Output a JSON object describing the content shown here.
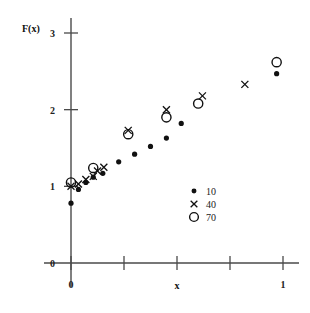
{
  "chart_data": {
    "type": "scatter",
    "title": "",
    "xlabel": "x",
    "ylabel": "F(x)",
    "xlim": [
      0,
      1
    ],
    "ylim": [
      0,
      3
    ],
    "grid": false,
    "legend_position": "inside-lower-right",
    "x_ticks": [
      0,
      0.25,
      0.5,
      0.75,
      1
    ],
    "x_tick_labels": [
      "0",
      "",
      "",
      "",
      "1"
    ],
    "y_ticks": [
      0,
      1,
      2,
      3
    ],
    "y_tick_labels": [
      "0",
      "1",
      "2",
      "3"
    ],
    "series": [
      {
        "name": "10",
        "marker": "filled-circle",
        "points": [
          [
            0.0,
            0.78
          ],
          [
            0.035,
            0.96
          ],
          [
            0.07,
            1.05
          ],
          [
            0.105,
            1.12
          ],
          [
            0.15,
            1.17
          ],
          [
            0.225,
            1.32
          ],
          [
            0.3,
            1.42
          ],
          [
            0.375,
            1.52
          ],
          [
            0.45,
            1.63
          ],
          [
            0.52,
            1.82
          ],
          [
            0.97,
            2.47
          ]
        ]
      },
      {
        "name": "40",
        "marker": "cross",
        "points": [
          [
            0.0,
            1.0
          ],
          [
            0.035,
            1.03
          ],
          [
            0.07,
            1.09
          ],
          [
            0.105,
            1.13
          ],
          [
            0.125,
            1.2
          ],
          [
            0.155,
            1.25
          ],
          [
            0.27,
            1.73
          ],
          [
            0.45,
            2.0
          ],
          [
            0.62,
            2.18
          ],
          [
            0.82,
            2.33
          ]
        ]
      },
      {
        "name": "70",
        "marker": "open-circle",
        "points": [
          [
            0.0,
            1.05
          ],
          [
            0.105,
            1.24
          ],
          [
            0.27,
            1.68
          ],
          [
            0.45,
            1.9
          ],
          [
            0.6,
            2.08
          ],
          [
            0.97,
            2.62
          ]
        ]
      }
    ]
  },
  "legend": {
    "entries": [
      {
        "label": "10",
        "marker": "filled-circle"
      },
      {
        "label": "40",
        "marker": "cross"
      },
      {
        "label": "70",
        "marker": "open-circle"
      }
    ]
  }
}
